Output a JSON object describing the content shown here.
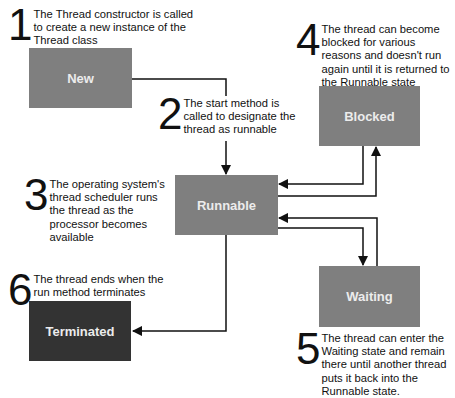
{
  "diagram": {
    "type": "state-diagram",
    "states": [
      {
        "id": "new",
        "label": "New"
      },
      {
        "id": "runnable",
        "label": "Runnable"
      },
      {
        "id": "blocked",
        "label": "Blocked"
      },
      {
        "id": "waiting",
        "label": "Waiting"
      },
      {
        "id": "terminated",
        "label": "Terminated"
      }
    ],
    "steps": [
      {
        "number": "1",
        "text": "The Thread constructor is called to create a new instance of the Thread class"
      },
      {
        "number": "2",
        "text": "The start method is called to designate the thread as runnable"
      },
      {
        "number": "3",
        "text": "The operating system's thread scheduler runs the thread as the processor becomes available"
      },
      {
        "number": "4",
        "text": "The thread can become blocked for various reasons and doesn't run again until it is returned to the Runnable state"
      },
      {
        "number": "5",
        "text": "The thread can enter the Waiting state and remain there until another thread puts it back into the Runnable state."
      },
      {
        "number": "6",
        "text": "The thread ends when the run method terminates"
      }
    ],
    "transitions": [
      {
        "from": "new",
        "to": "runnable"
      },
      {
        "from": "runnable",
        "to": "blocked"
      },
      {
        "from": "blocked",
        "to": "runnable"
      },
      {
        "from": "runnable",
        "to": "waiting"
      },
      {
        "from": "waiting",
        "to": "runnable"
      },
      {
        "from": "runnable",
        "to": "terminated"
      }
    ],
    "colors": {
      "state_fill": "#7f7f7f",
      "terminated_fill": "#333333",
      "state_text": "#ececec",
      "line": "#111111"
    }
  }
}
